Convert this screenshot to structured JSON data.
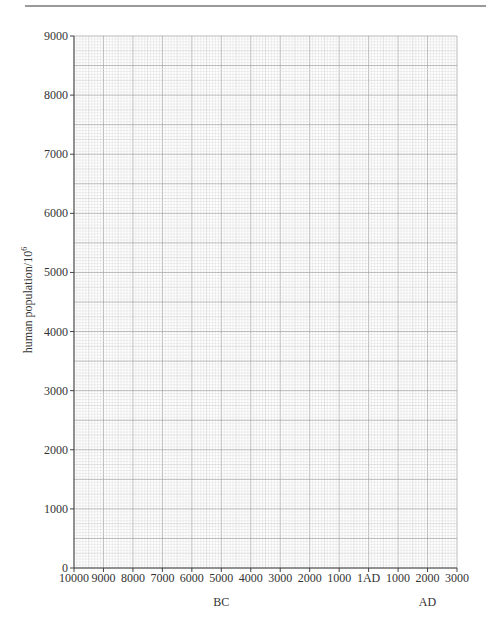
{
  "chart_data": {
    "type": "line",
    "title": "",
    "xlabel": "",
    "ylabel": "human population/10",
    "ylabel_superscript": "6",
    "x_ticks": [
      "10000",
      "9000",
      "8000",
      "7000",
      "6000",
      "5000",
      "4000",
      "3000",
      "2000",
      "1000",
      "1AD",
      "1000",
      "2000",
      "3000"
    ],
    "x_tick_values": [
      -10000,
      -9000,
      -8000,
      -7000,
      -6000,
      -5000,
      -4000,
      -3000,
      -2000,
      -1000,
      0,
      1000,
      2000,
      3000
    ],
    "x_era_labels": [
      {
        "text": "BC",
        "x_value": -5000
      },
      {
        "text": "AD",
        "x_value": 2000
      }
    ],
    "y_ticks": [
      "0",
      "1000",
      "2000",
      "3000",
      "4000",
      "5000",
      "6000",
      "7000",
      "8000",
      "9000"
    ],
    "y_tick_values": [
      0,
      1000,
      2000,
      3000,
      4000,
      5000,
      6000,
      7000,
      8000,
      9000
    ],
    "xlim": [
      -10000,
      3000
    ],
    "ylim": [
      0,
      9000
    ],
    "grid": true,
    "grid_style": "graph paper (fine 1mm, medium 5mm, heavy 10mm)",
    "series": []
  },
  "colors": {
    "fine_grid": "#dcdcdc",
    "medium_grid": "#c4c4c4",
    "heavy_grid": "#a8a8a8",
    "axis": "#444444",
    "header_rule": "#9a9a9a"
  }
}
